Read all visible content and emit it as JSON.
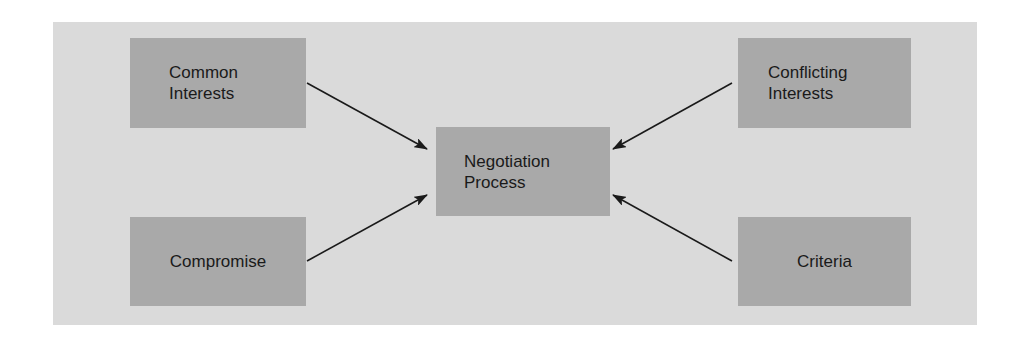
{
  "diagram": {
    "type": "flow",
    "colors": {
      "panel_background": "#dadada",
      "node_fill": "#a9a9a9",
      "text": "#1a1a1a",
      "arrow": "#1a1a1a"
    },
    "nodes": {
      "common_interests": {
        "label": "Common\nInterests"
      },
      "compromise": {
        "label": "Compromise"
      },
      "negotiation_process": {
        "label": "Negotiation\nProcess"
      },
      "conflicting_interests": {
        "label": "Conflicting\nInterests"
      },
      "criteria": {
        "label": "Criteria"
      }
    },
    "edges": [
      {
        "from": "Common Interests",
        "to": "Negotiation Process"
      },
      {
        "from": "Compromise",
        "to": "Negotiation Process"
      },
      {
        "from": "Conflicting Interests",
        "to": "Negotiation Process"
      },
      {
        "from": "Criteria",
        "to": "Negotiation Process"
      }
    ]
  }
}
